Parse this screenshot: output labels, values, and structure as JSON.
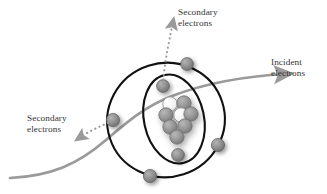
{
  "figure": {
    "type": "diagram"
  },
  "labels": {
    "secondary_top": {
      "line1": "Secondary",
      "line2": "electrons"
    },
    "secondary_left": {
      "line1": "Secondary",
      "line2": "electrons"
    },
    "incident": {
      "line1": "Incident",
      "line2": "electrons"
    }
  },
  "colors": {
    "orbit_stroke": "#111111",
    "electron_fill": "#8c8c8c",
    "electron_stroke": "#5f5f5f",
    "nucleon_fill": "#8f8f8f",
    "nucleon_light_fill": "#f2f2f2",
    "nucleon_stroke": "#6a6a6a",
    "incident_path": "#9a9a9a",
    "secondary_arrow": "#9a9a9a",
    "text": "#333333",
    "background": "#ffffff",
    "shadow": "#c9c9c9"
  },
  "atom": {
    "nucleus": {
      "center_x": 178,
      "center_y": 118,
      "nucleon_radius": 7.2,
      "nucleons": [
        {
          "x": 170,
          "y": 104,
          "shade": "light"
        },
        {
          "x": 184,
          "y": 103,
          "shade": "dark"
        },
        {
          "x": 166,
          "y": 115,
          "shade": "dark"
        },
        {
          "x": 180,
          "y": 115,
          "shade": "light"
        },
        {
          "x": 190,
          "y": 113,
          "shade": "dark"
        },
        {
          "x": 170,
          "y": 127,
          "shade": "dark"
        },
        {
          "x": 184,
          "y": 126,
          "shade": "dark"
        },
        {
          "x": 177,
          "y": 137,
          "shade": "dark"
        }
      ]
    },
    "orbits": [
      {
        "name": "outer-orbit",
        "cx": 166,
        "cy": 120,
        "rx": 59,
        "ry": 57,
        "rotation": -18
      },
      {
        "name": "inner-orbit",
        "cx": 174,
        "cy": 119,
        "rx": 30,
        "ry": 45,
        "rotation": -12
      }
    ],
    "electrons": [
      {
        "name": "electron-outer-top-right",
        "x": 187,
        "y": 64,
        "r": 6.4,
        "orbit": "outer"
      },
      {
        "name": "electron-inner-top",
        "x": 163,
        "y": 86,
        "r": 6.4,
        "orbit": "inner"
      },
      {
        "name": "electron-outer-left",
        "x": 113,
        "y": 120,
        "r": 6.6,
        "orbit": "outer"
      },
      {
        "name": "electron-outer-right",
        "x": 218,
        "y": 145,
        "r": 6.6,
        "orbit": "outer"
      },
      {
        "name": "electron-inner-bottom",
        "x": 178,
        "y": 155,
        "r": 6.4,
        "orbit": "inner"
      },
      {
        "name": "electron-outer-bottom",
        "x": 150,
        "y": 176,
        "r": 6.6,
        "orbit": "outer"
      }
    ]
  },
  "paths": {
    "incident_electrons": {
      "name": "incident-electron-path",
      "description": "S-shaped gray curve entering lower-left, deflecting around nucleus, exiting upper-right with arrowhead",
      "stroke_width": 2.6
    },
    "secondary_up": {
      "name": "secondary-electron-arrow-up",
      "description": "Dotted gray arrow from inner-orbit top electron upward to top label"
    },
    "secondary_left": {
      "name": "secondary-electron-arrow-left",
      "description": "Dotted gray arrow from outer-orbit left electron toward lower-left label"
    }
  }
}
